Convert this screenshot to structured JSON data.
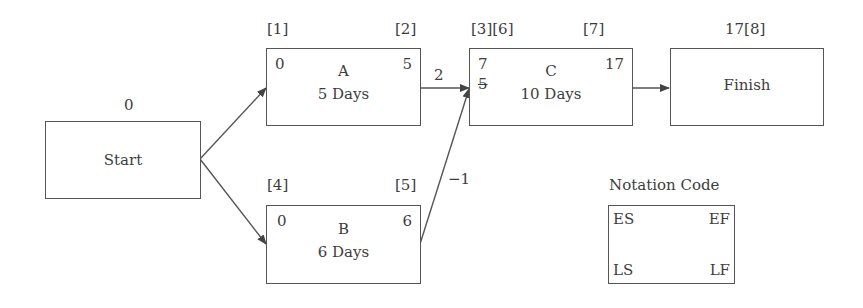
{
  "diagram": {
    "type": "precedence network (CPM)",
    "nodes": {
      "start": {
        "name": "Start",
        "top_label": "0"
      },
      "a": {
        "name": "A",
        "duration": "5 Days",
        "es": "0",
        "ef": "5",
        "tag_left": "[1]",
        "tag_right": "[2]"
      },
      "b": {
        "name": "B",
        "duration": "6 Days",
        "es": "0",
        "ef": "6",
        "tag_left": "[4]",
        "tag_right": "[5]"
      },
      "c": {
        "name": "C",
        "duration": "10 Days",
        "es": "7",
        "es_struck": "5",
        "ef": "17",
        "tag_left": "[3][6]",
        "tag_right": "[7]"
      },
      "finish": {
        "name": "Finish",
        "top_label": "17[8]"
      }
    },
    "edges": [
      {
        "from": "Start",
        "to": "A",
        "label": ""
      },
      {
        "from": "Start",
        "to": "B",
        "label": ""
      },
      {
        "from": "A",
        "to": "C",
        "label": "2"
      },
      {
        "from": "B",
        "to": "C",
        "label": "−1"
      },
      {
        "from": "C",
        "to": "Finish",
        "label": ""
      }
    ],
    "legend": {
      "title": "Notation Code",
      "top_left": "ES",
      "top_right": "EF",
      "bottom_left": "LS",
      "bottom_right": "LF"
    },
    "colors": {
      "line": "#555555",
      "text": "#3d3d3d",
      "background": "#ffffff"
    }
  }
}
